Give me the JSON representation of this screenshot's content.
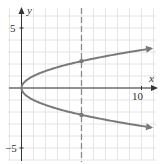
{
  "chart_data": {
    "type": "line",
    "title": "",
    "xlabel": "x",
    "ylabel": "y",
    "xlim": [
      -3.5,
      11.5
    ],
    "ylim": [
      -6,
      7
    ],
    "grid": true,
    "x_ticks_labeled": [
      {
        "value": 10,
        "label": "10"
      }
    ],
    "y_ticks_labeled": [
      {
        "value": 5,
        "label": "5"
      },
      {
        "value": -5,
        "label": "−5"
      }
    ],
    "series": [
      {
        "name": "x = y^2 (upper branch)",
        "equation": "y = sqrt(x)",
        "x": [
          0,
          0.25,
          1,
          2,
          3,
          4,
          5,
          6,
          7,
          8,
          9,
          10,
          10.8
        ],
        "values": [
          0,
          0.5,
          1,
          1.41,
          1.73,
          2,
          2.24,
          2.45,
          2.65,
          2.83,
          3,
          3.16,
          3.29
        ],
        "arrow_end": true
      },
      {
        "name": "x = y^2 (lower branch)",
        "equation": "y = -sqrt(x)",
        "x": [
          0,
          0.25,
          1,
          2,
          3,
          4,
          5,
          6,
          7,
          8,
          9,
          10,
          10.8
        ],
        "values": [
          0,
          -0.5,
          -1,
          -1.41,
          -1.73,
          -2,
          -2.24,
          -2.45,
          -2.65,
          -2.83,
          -3,
          -3.16,
          -3.29
        ],
        "arrow_end": true
      }
    ],
    "vertical_lines": [
      {
        "x": 5,
        "style": "dashed"
      }
    ],
    "points": [
      {
        "x": 5,
        "y": 2.24
      },
      {
        "x": 5,
        "y": -2.24
      }
    ],
    "colors": {
      "curve": "#7a7a7a",
      "grid": "#e4e4e4",
      "axis": "#333333",
      "dashed": "#8a8a8a"
    }
  }
}
